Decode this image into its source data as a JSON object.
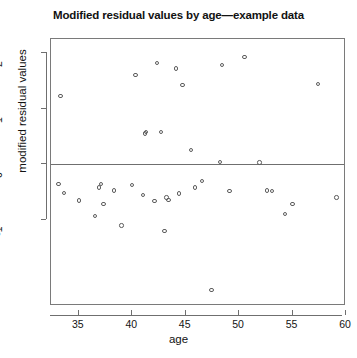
{
  "chart_data": {
    "type": "scatter",
    "title": "Modified residual values by age—example data",
    "xlabel": "age",
    "ylabel": "modified residual values",
    "xlim": [
      32.4,
      60.0
    ],
    "ylim": [
      -2.55,
      2.25
    ],
    "xticks": [
      35,
      40,
      45,
      50,
      55,
      60
    ],
    "yticks": [
      -1,
      0,
      1,
      2
    ],
    "grid": false,
    "legend": null,
    "reference_line": {
      "orientation": "horizontal",
      "y": 0
    },
    "marker": "open-circle",
    "x": [
      33.3,
      33.1,
      33.6,
      35.0,
      36.5,
      36.9,
      37.1,
      37.3,
      38.3,
      39.0,
      40.0,
      40.3,
      41.0,
      41.2,
      41.3,
      42.1,
      42.3,
      42.7,
      43.0,
      43.2,
      43.4,
      44.1,
      44.4,
      44.7,
      45.5,
      45.9,
      46.5,
      47.4,
      48.2,
      48.4,
      49.1,
      50.5,
      51.9,
      52.6,
      53.1,
      54.3,
      55.0,
      57.4,
      59.1
    ],
    "y": [
      1.22,
      -0.36,
      -0.52,
      -0.65,
      -0.93,
      -0.42,
      -0.36,
      -0.72,
      -0.47,
      -1.1,
      -0.37,
      1.6,
      -0.55,
      0.55,
      0.58,
      -0.66,
      1.82,
      0.58,
      -1.2,
      -0.6,
      -0.64,
      1.72,
      -0.53,
      1.42,
      0.25,
      -0.42,
      -0.3,
      -2.26,
      0.04,
      1.78,
      -0.48,
      1.93,
      0.03,
      -0.47,
      -0.48,
      -0.9,
      -0.72,
      1.44,
      -0.6
    ]
  }
}
